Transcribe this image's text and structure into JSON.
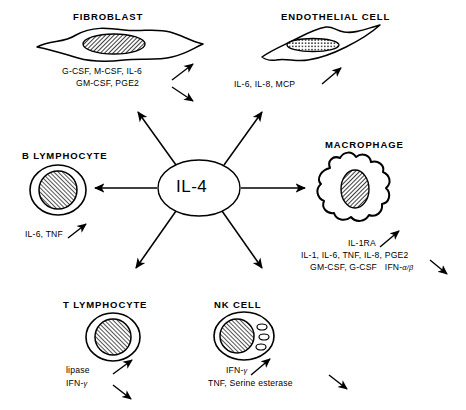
{
  "diagram": {
    "type": "radial-cell-signaling",
    "hub": {
      "label": "IL-4",
      "shape": "circle"
    },
    "arrow_count": 6,
    "nodes": [
      {
        "id": "fibroblast",
        "title": "FIBROBLAST",
        "cell_shape": "spindle-flat",
        "nucleus": "hatched-ellipse",
        "products": [
          "G-CSF, M-CSF, IL-6",
          "GM-CSF, PGE2"
        ],
        "effect_arrows": [
          "up-right",
          "down-right"
        ]
      },
      {
        "id": "endothelial-cell",
        "title": "ENDOTHELIAL CELL",
        "cell_shape": "flattened-elongated",
        "nucleus": "dotted-ellipse",
        "products": [
          "IL-6, IL-8, MCP"
        ],
        "effect_arrows": [
          "up-right"
        ]
      },
      {
        "id": "b-lymphocyte",
        "title": "B LYMPHOCYTE",
        "cell_shape": "round",
        "nucleus": "hatched-circle",
        "products": [
          "IL-6, TNF"
        ],
        "effect_arrows": [
          "up-right"
        ]
      },
      {
        "id": "macrophage",
        "title": "MACROPHAGE",
        "cell_shape": "amoeboid-irregular",
        "nucleus": "hatched-ellipse",
        "products": [
          "IL-1RA",
          "IL-1, IL-6, TNF, IL-8, PGE2",
          "GM-CSF, G-CSF   IFN-α/β"
        ],
        "effect_arrows": [
          "up-right",
          "down-right"
        ]
      },
      {
        "id": "t-lymphocyte",
        "title": "T LYMPHOCYTE",
        "cell_shape": "round",
        "nucleus": "hatched-circle",
        "products": [
          "lipase",
          "IFN-γ"
        ],
        "effect_arrows": [
          "up-right",
          "down-right"
        ]
      },
      {
        "id": "nk-cell",
        "title": "NK CELL",
        "cell_shape": "round-granular",
        "nucleus": "hatched-circle",
        "granules": 3,
        "products": [
          "IFN-γ",
          "TNF, Serine esterase"
        ],
        "effect_arrows": [
          "up-right",
          "down-right"
        ]
      }
    ]
  },
  "labels": {
    "fibroblast_title": "FIBROBLAST",
    "fibroblast_line1": "G-CSF, M-CSF, IL-6",
    "fibroblast_line2": "GM-CSF, PGE2",
    "endothelial_title": "ENDOTHELIAL CELL",
    "endothelial_line1": "IL-6, IL-8, MCP",
    "blymph_title": "B LYMPHOCYTE",
    "blymph_line1": "IL-6, TNF",
    "macrophage_title": "MACROPHAGE",
    "macrophage_line1": "IL-1RA",
    "macrophage_line2": "IL-1, IL-6, TNF, IL-8, PGE2",
    "macrophage_line3a": "GM-CSF, G-CSF",
    "macrophage_line3b": "IFN-",
    "macrophage_line3c": "α/β",
    "tlymph_title": "T LYMPHOCYTE",
    "tlymph_line1": "lipase",
    "tlymph_line2a": "IFN-",
    "tlymph_line2b": "γ",
    "nk_title": "NK CELL",
    "nk_line1a": "IFN-",
    "nk_line1b": "γ",
    "nk_line2": "TNF, Serine esterase",
    "hub_label": "IL-4"
  },
  "colors": {
    "ink": "#000000",
    "background": "#ffffff",
    "nucleus_fill": "#6b6b6b"
  }
}
